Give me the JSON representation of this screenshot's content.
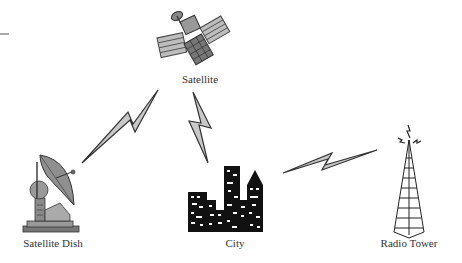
{
  "diagram": {
    "type": "wireless communication network",
    "nodes": [
      {
        "id": "satellite",
        "label": "Satellite",
        "icon": "satellite-icon"
      },
      {
        "id": "satellite_dish",
        "label": "Satellite Dish",
        "icon": "satellite-dish-icon"
      },
      {
        "id": "city",
        "label": "City",
        "icon": "city-skyline-icon"
      },
      {
        "id": "radio_tower",
        "label": "Radio Tower",
        "icon": "radio-tower-icon"
      }
    ],
    "links": [
      {
        "from": "satellite_dish",
        "to": "satellite",
        "icon": "lightning-bolt-icon"
      },
      {
        "from": "satellite",
        "to": "city",
        "icon": "lightning-bolt-icon"
      },
      {
        "from": "city",
        "to": "radio_tower",
        "icon": "lightning-bolt-icon"
      }
    ],
    "colors": {
      "bolt_fill": "#c8c8c8",
      "bolt_stroke": "#333333",
      "city_fill": "#111111",
      "icon_gray": "#8a8a8a"
    }
  }
}
